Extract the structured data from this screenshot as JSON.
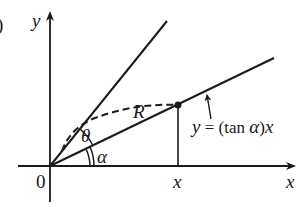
{
  "figure": {
    "part_marker": ")",
    "axis_labels": {
      "y": "y",
      "x": "x"
    },
    "origin_label": "0",
    "point_x_label": "x",
    "radius_label": "R",
    "angle_theta_label": "θ",
    "angle_alpha_label": "α",
    "line_equation": {
      "y": "y",
      "equals": " = ",
      "open": "(tan ",
      "alpha": "α",
      "close": ")",
      "x": "x"
    }
  }
}
